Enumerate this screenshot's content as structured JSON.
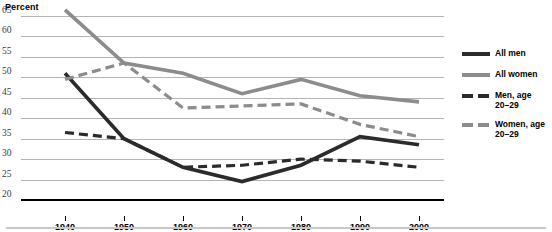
{
  "chart_data": {
    "type": "line",
    "title": "Percent",
    "xlabel": "",
    "ylabel": "Percent",
    "x": [
      1940,
      1950,
      1960,
      1970,
      1980,
      1990,
      2000
    ],
    "categories": [
      "1940",
      "1950",
      "1960",
      "1970",
      "1980",
      "1990",
      "2000"
    ],
    "ylim": [
      20,
      65
    ],
    "yticks": [
      20,
      25,
      30,
      35,
      40,
      45,
      50,
      55,
      60,
      65
    ],
    "ytick_labels": [
      "20",
      "25",
      "30",
      "35",
      "40",
      "45",
      "50",
      "55",
      "60",
      "65"
    ],
    "grid": true,
    "legend_position": "right",
    "series": [
      {
        "name": "All men",
        "values": [
          51,
          35,
          28,
          24.5,
          28.5,
          35.5,
          33.5
        ],
        "color": "#2b2b2b",
        "style": "solid",
        "width": 3.6
      },
      {
        "name": "All women",
        "values": [
          66.5,
          53.5,
          51,
          46,
          49.5,
          45.5,
          44
        ],
        "color": "#8c8c8c",
        "style": "solid",
        "width": 3.6
      },
      {
        "name": "Men, age 20–29",
        "values": [
          36.5,
          35,
          28,
          28.5,
          30,
          29.5,
          28
        ],
        "color": "#2b2b2b",
        "style": "dashed",
        "width": 3.2
      },
      {
        "name": "Women, age 20–29",
        "values": [
          49.5,
          53.5,
          42.5,
          43,
          43.5,
          38.5,
          35.5
        ],
        "color": "#8c8c8c",
        "style": "dashed",
        "width": 3.2
      }
    ]
  },
  "legend": {
    "items": [
      {
        "label_line1": "All men",
        "label_line2": ""
      },
      {
        "label_line1": "All women",
        "label_line2": ""
      },
      {
        "label_line1": "Men, age",
        "label_line2": "20–29"
      },
      {
        "label_line1": "Women, age",
        "label_line2": "20–29"
      }
    ]
  }
}
